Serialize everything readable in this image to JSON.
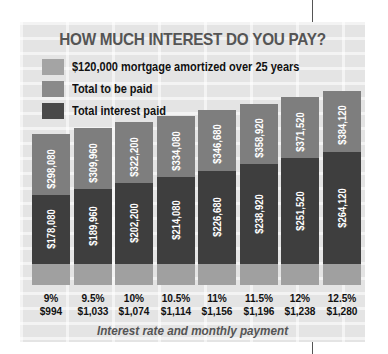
{
  "chart_data": {
    "type": "bar",
    "title": "HOW MUCH INTEREST DO YOU PAY?",
    "xlabel": "Interest rate and monthly payment",
    "ylabel": "",
    "categories": [
      "9%",
      "9.5%",
      "10%",
      "10.5%",
      "11%",
      "11.5%",
      "12%",
      "12.5%"
    ],
    "monthly_payments": [
      "$994",
      "$1,033",
      "$1,074",
      "$1,114",
      "$1,156",
      "$1,196",
      "$1,238",
      "$1,280"
    ],
    "series": [
      {
        "name": "$120,000 mortgage amortized over 25 years",
        "values": [
          120000,
          120000,
          120000,
          120000,
          120000,
          120000,
          120000,
          120000
        ]
      },
      {
        "name": "Total to be paid",
        "values": [
          298080,
          309960,
          322200,
          334080,
          346680,
          358920,
          371520,
          384120
        ],
        "labels": [
          "$298,080",
          "$309,960",
          "$322,200",
          "$334,080",
          "$346,680",
          "$358,920",
          "$371,520",
          "$384,120"
        ]
      },
      {
        "name": "Total interest paid",
        "values": [
          178080,
          189960,
          202200,
          214080,
          226680,
          238920,
          251520,
          264120
        ],
        "labels": [
          "$178,080",
          "$189,960",
          "$202,200",
          "$214,080",
          "$226,680",
          "$238,920",
          "$251,520",
          "$264,120"
        ]
      }
    ],
    "legend_position": "top-left",
    "grid": false
  },
  "legend": {
    "principal": "$120,000 mortgage amortized over 25 years",
    "total": "Total to be paid",
    "interest": "Total interest paid"
  }
}
